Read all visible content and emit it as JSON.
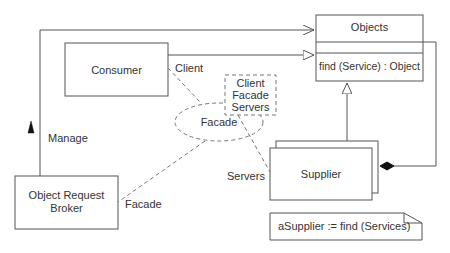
{
  "diagram": {
    "type": "UML collaboration / class diagram",
    "classes": {
      "objects": {
        "name": "Objects",
        "operation": "find (Service) : Object"
      },
      "consumer": {
        "name": "Consumer"
      },
      "orb": {
        "name_line1": "Object Request",
        "name_line2": "Broker"
      },
      "supplier": {
        "name": "Supplier"
      }
    },
    "collaboration": {
      "name": "Facade",
      "parameters": [
        "Client",
        "Facade",
        "Servers"
      ]
    },
    "role_labels": {
      "client": "Client",
      "servers": "Servers",
      "facade": "Facade",
      "manage": "Manage"
    },
    "note": {
      "text": "aSupplier := find (Services)"
    },
    "colors": {
      "line": "#555555",
      "text": "#333333",
      "background": "#ffffff"
    }
  }
}
